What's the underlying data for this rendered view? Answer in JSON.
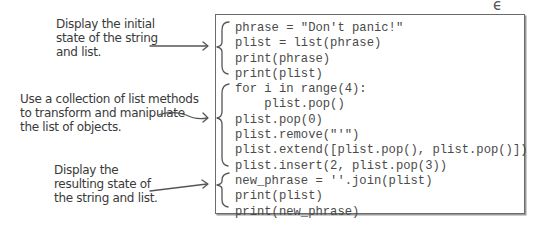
{
  "annotations": [
    {
      "id": "initial-state",
      "lines": [
        "Display the initial",
        "state of the string",
        "and list."
      ]
    },
    {
      "id": "transform",
      "lines": [
        "Use a collection of list methods",
        "to transform and manipulate",
        "the list of objects."
      ]
    },
    {
      "id": "resulting-state",
      "lines": [
        "Display the",
        "resulting state of",
        "the string and list."
      ]
    }
  ],
  "code": {
    "lines": [
      "phrase = \"Don't panic!\"",
      "plist = list(phrase)",
      "print(phrase)",
      "print(plist)",
      "for i in range(4):",
      "    plist.pop()",
      "plist.pop(0)",
      "plist.remove(\"'\")",
      "plist.extend([plist.pop(), plist.pop()])",
      "plist.insert(2, plist.pop(3))",
      "new_phrase = ''.join(plist)",
      "print(plist)",
      "print(new_phrase)"
    ]
  },
  "decorations": {
    "corner_glyph": "ϵ",
    "stroke_color": "#555555",
    "border_color": "#6b6b6b",
    "code_color": "#4a4a4a"
  }
}
